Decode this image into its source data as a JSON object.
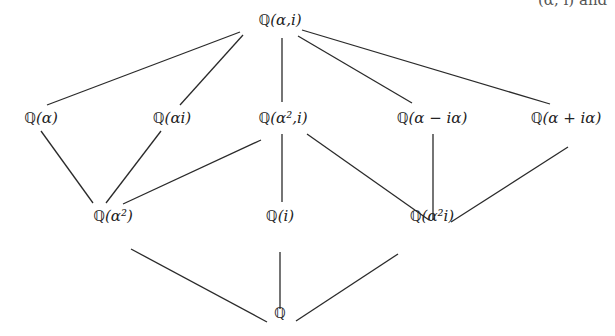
{
  "diagram": {
    "type": "subfield-lattice",
    "clipped_top_right_text": "(α, i) and",
    "nodes": [
      {
        "id": "top",
        "bb": "ℚ",
        "label": "(α,i)",
        "x": 280,
        "y": 20
      },
      {
        "id": "q_alpha",
        "bb": "ℚ",
        "label": "(α)",
        "x": 41,
        "y": 118
      },
      {
        "id": "q_alphai",
        "bb": "ℚ",
        "label": "(αi)",
        "x": 172,
        "y": 118
      },
      {
        "id": "q_alpha2_i",
        "bb": "ℚ",
        "label": "(α²,i)",
        "x": 283,
        "y": 118
      },
      {
        "id": "q_a_minus",
        "bb": "ℚ",
        "label": "(α − iα)",
        "x": 432,
        "y": 118
      },
      {
        "id": "q_a_plus",
        "bb": "ℚ",
        "label": "(α + iα)",
        "x": 566,
        "y": 118
      },
      {
        "id": "q_alpha2",
        "bb": "ℚ",
        "label": "(α²)",
        "x": 113,
        "y": 216
      },
      {
        "id": "q_i",
        "bb": "ℚ",
        "label": "(i)",
        "x": 280,
        "y": 216
      },
      {
        "id": "q_alpha2i",
        "bb": "ℚ",
        "label": "(α²i)",
        "x": 432,
        "y": 216
      },
      {
        "id": "bottom",
        "bb": "ℚ",
        "label": "",
        "x": 280,
        "y": 313
      }
    ],
    "edges": [
      {
        "from": "top",
        "to": "q_alpha",
        "x1": 240,
        "y1": 32,
        "x2": 47,
        "y2": 105
      },
      {
        "from": "top",
        "to": "q_alphai",
        "x1": 243,
        "y1": 35,
        "x2": 180,
        "y2": 105
      },
      {
        "from": "top",
        "to": "q_alpha2_i",
        "x1": 282,
        "y1": 38,
        "x2": 282,
        "y2": 102
      },
      {
        "from": "top",
        "to": "q_a_minus",
        "x1": 298,
        "y1": 36,
        "x2": 412,
        "y2": 103
      },
      {
        "from": "top",
        "to": "q_a_plus",
        "x1": 302,
        "y1": 30,
        "x2": 550,
        "y2": 104
      },
      {
        "from": "q_alpha",
        "to": "q_alpha2",
        "x1": 41,
        "y1": 131,
        "x2": 93,
        "y2": 203
      },
      {
        "from": "q_alphai",
        "to": "q_alpha2",
        "x1": 161,
        "y1": 131,
        "x2": 106,
        "y2": 203
      },
      {
        "from": "q_alpha2_i",
        "to": "q_alpha2",
        "x1": 261,
        "y1": 140,
        "x2": 123,
        "y2": 204
      },
      {
        "from": "q_alpha2_i",
        "to": "q_i",
        "x1": 282,
        "y1": 134,
        "x2": 282,
        "y2": 202
      },
      {
        "from": "q_alpha2_i",
        "to": "q_alpha2i",
        "x1": 307,
        "y1": 134,
        "x2": 429,
        "y2": 220
      },
      {
        "from": "q_a_minus",
        "to": "q_alpha2i",
        "x1": 433,
        "y1": 134,
        "x2": 433,
        "y2": 220
      },
      {
        "from": "q_a_plus",
        "to": "q_alpha2i",
        "x1": 568,
        "y1": 147,
        "x2": 451,
        "y2": 222
      },
      {
        "from": "q_alpha2",
        "to": "bottom",
        "x1": 131,
        "y1": 249,
        "x2": 267,
        "y2": 322
      },
      {
        "from": "q_i",
        "to": "bottom",
        "x1": 280,
        "y1": 252,
        "x2": 280,
        "y2": 309
      },
      {
        "from": "q_alpha2i",
        "to": "bottom",
        "x1": 398,
        "y1": 254,
        "x2": 296,
        "y2": 321
      }
    ]
  }
}
